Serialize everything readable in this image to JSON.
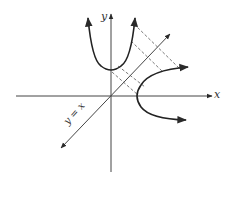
{
  "diagram": {
    "labels": {
      "x_axis": "x",
      "y_axis": "y",
      "diagonal": "y = x"
    },
    "elements": [
      {
        "type": "axis",
        "name": "x-axis"
      },
      {
        "type": "axis",
        "name": "y-axis"
      },
      {
        "type": "line",
        "name": "line y = x",
        "style": "solid with arrows"
      },
      {
        "type": "curve",
        "name": "upward parabola",
        "vertex": "on y-axis above origin"
      },
      {
        "type": "curve",
        "name": "rightward parabola (reflection)",
        "vertex": "on x-axis right of origin"
      },
      {
        "type": "segments",
        "name": "reflection guides",
        "style": "dashed",
        "count": 4
      }
    ],
    "colors": {
      "stroke": "#2a2a2a",
      "background": "#ffffff"
    }
  }
}
